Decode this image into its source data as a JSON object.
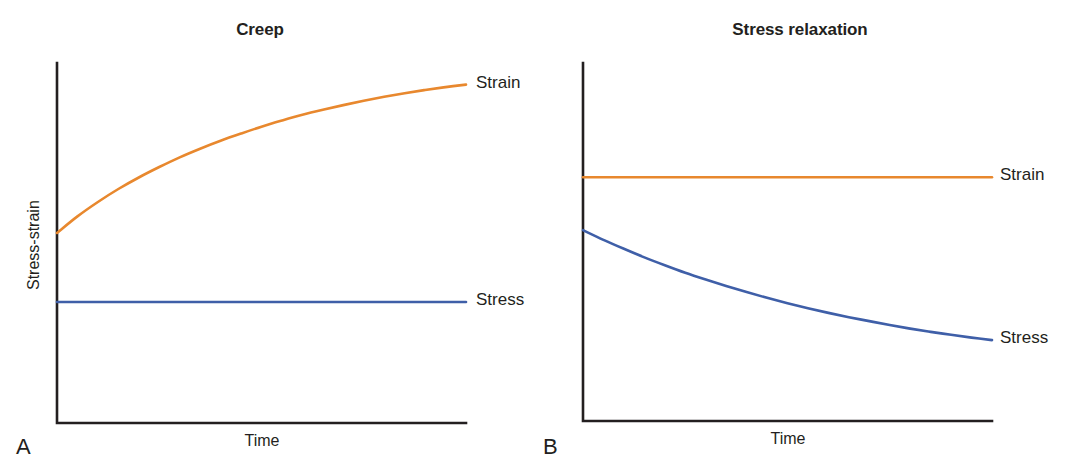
{
  "figure": {
    "background": "#ffffff",
    "axis_color": "#231f20",
    "strain_color": "#e8882e",
    "stress_color": "#3f5fa8"
  },
  "panels": [
    {
      "letter": "A",
      "title": "Creep",
      "ylabel": "Stress-strain",
      "xlabel": "Time",
      "series_labels": {
        "strain": "Strain",
        "stress": "Stress"
      }
    },
    {
      "letter": "B",
      "title": "Stress relaxation",
      "ylabel": "Stress-strain",
      "xlabel": "Time",
      "series_labels": {
        "strain": "Strain",
        "stress": "Stress"
      }
    }
  ],
  "chart_data": [
    {
      "type": "line",
      "title": "Creep",
      "xlabel": "Time",
      "ylabel": "Stress-strain",
      "xlim": [
        0,
        1
      ],
      "ylim": [
        0,
        1
      ],
      "grid": false,
      "legend_position": "right-inline",
      "annotations": [
        "A"
      ],
      "x": [
        0,
        0.05,
        0.1,
        0.15,
        0.2,
        0.25,
        0.3,
        0.35,
        0.4,
        0.45,
        0.5,
        0.55,
        0.6,
        0.65,
        0.7,
        0.75,
        0.8,
        0.85,
        0.9,
        0.95,
        1
      ],
      "series": [
        {
          "name": "Strain",
          "color": "#e8882e",
          "description": "Strain rises steeply then saturates (creep response under constant stress)",
          "values": [
            0.528,
            0.574,
            0.614,
            0.65,
            0.682,
            0.711,
            0.738,
            0.762,
            0.784,
            0.804,
            0.823,
            0.84,
            0.856,
            0.87,
            0.883,
            0.895,
            0.906,
            0.916,
            0.925,
            0.933,
            0.94
          ]
        },
        {
          "name": "Stress",
          "color": "#3f5fa8",
          "description": "Stress held constant",
          "values": [
            0.336,
            0.336,
            0.336,
            0.336,
            0.336,
            0.336,
            0.336,
            0.336,
            0.336,
            0.336,
            0.336,
            0.336,
            0.336,
            0.336,
            0.336,
            0.336,
            0.336,
            0.336,
            0.336,
            0.336,
            0.336
          ]
        }
      ]
    },
    {
      "type": "line",
      "title": "Stress relaxation",
      "xlabel": "Time",
      "ylabel": "Stress-strain",
      "xlim": [
        0,
        1
      ],
      "ylim": [
        0,
        1
      ],
      "grid": false,
      "legend_position": "right-inline",
      "annotations": [
        "B"
      ],
      "x": [
        0,
        0.05,
        0.1,
        0.15,
        0.2,
        0.25,
        0.3,
        0.35,
        0.4,
        0.45,
        0.5,
        0.55,
        0.6,
        0.65,
        0.7,
        0.75,
        0.8,
        0.85,
        0.9,
        0.95,
        1
      ],
      "series": [
        {
          "name": "Strain",
          "color": "#e8882e",
          "description": "Strain held constant",
          "values": [
            0.681,
            0.681,
            0.681,
            0.681,
            0.681,
            0.681,
            0.681,
            0.681,
            0.681,
            0.681,
            0.681,
            0.681,
            0.681,
            0.681,
            0.681,
            0.681,
            0.681,
            0.681,
            0.681,
            0.681,
            0.681
          ]
        },
        {
          "name": "Stress",
          "color": "#3f5fa8",
          "description": "Stress decays exponentially toward a plateau (relaxation at constant strain)",
          "values": [
            0.533,
            0.506,
            0.481,
            0.457,
            0.435,
            0.414,
            0.395,
            0.377,
            0.36,
            0.344,
            0.329,
            0.315,
            0.302,
            0.29,
            0.279,
            0.268,
            0.258,
            0.249,
            0.241,
            0.233,
            0.226
          ]
        }
      ]
    }
  ]
}
